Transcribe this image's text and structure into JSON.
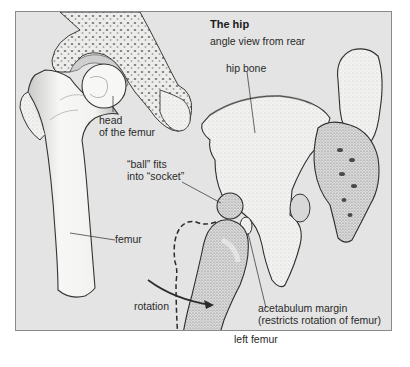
{
  "figure": {
    "title": "The hip",
    "subtitle": "angle view from rear",
    "colors": {
      "background": "#e4e4e4",
      "frame_border": "#8a8a8a",
      "bone_fill": "#f4f4f2",
      "bone_shade": "#bdbdbd",
      "outline": "#2a2a2a",
      "label_text": "#2a2a2a"
    }
  },
  "labels": {
    "head_of_femur_line1": "head",
    "head_of_femur_line2": "of the femur",
    "hip_bone": "hip bone",
    "ball_line1": "“ball” fits",
    "ball_line2": "into “socket”",
    "femur": "femur",
    "rotation": "rotation",
    "acetabulum_line1": "acetabulum margin",
    "acetabulum_line2": "(restricts rotation of femur)",
    "left_femur": "left femur"
  }
}
